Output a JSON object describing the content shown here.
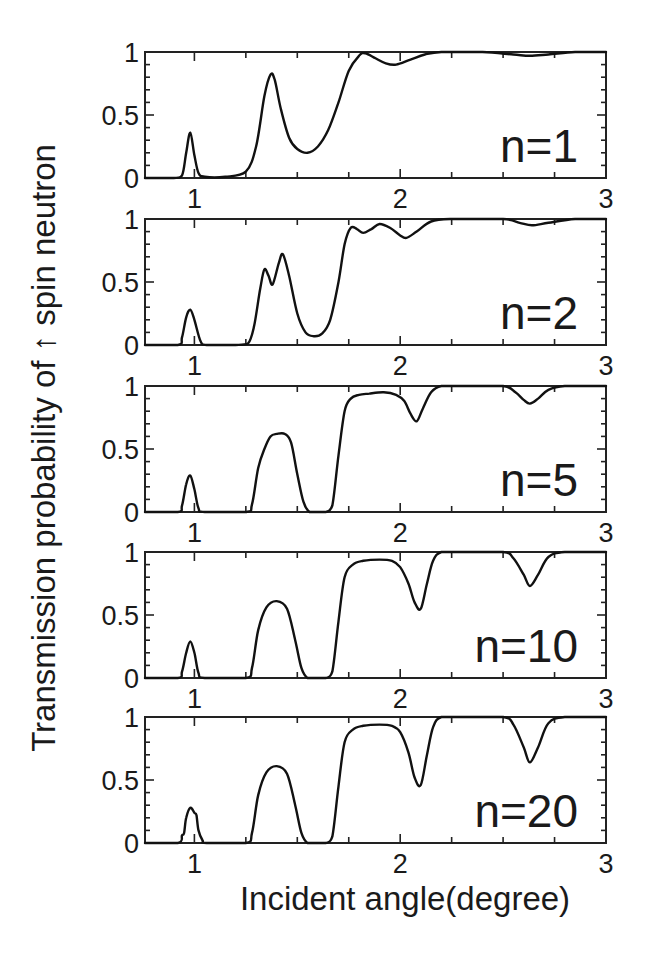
{
  "chart_data": {
    "type": "line",
    "title": "",
    "xlabel": "Incident angle(degree)",
    "ylabel": "Transmission probability of ↑ spin neutron",
    "xlim": [
      0.76,
      3.0
    ],
    "ylim": [
      0,
      1
    ],
    "xticks": [
      1,
      2,
      3
    ],
    "xtick_labels": [
      "1",
      "2",
      "3"
    ],
    "x_minor_step": 0.25,
    "yticks": [
      0,
      0.5,
      1
    ],
    "ytick_labels": [
      "0",
      "0.5",
      "1"
    ],
    "y_minor_step": 0.1,
    "grid": false,
    "layout": "5 vertically stacked panels sharing x axis",
    "panels": [
      {
        "label": "n=1",
        "x": [
          0.76,
          0.9,
          0.94,
          0.96,
          0.98,
          1.0,
          1.02,
          1.05,
          1.15,
          1.25,
          1.3,
          1.34,
          1.37,
          1.39,
          1.42,
          1.46,
          1.5,
          1.55,
          1.6,
          1.65,
          1.7,
          1.75,
          1.8,
          1.83,
          1.88,
          1.93,
          1.98,
          2.05,
          2.12,
          2.2,
          2.4,
          2.55,
          2.63,
          2.72,
          2.85,
          3.0
        ],
        "y": [
          0.0,
          0.0,
          0.02,
          0.2,
          0.36,
          0.18,
          0.04,
          0.01,
          0.01,
          0.05,
          0.25,
          0.65,
          0.82,
          0.78,
          0.55,
          0.32,
          0.23,
          0.2,
          0.25,
          0.38,
          0.6,
          0.85,
          0.97,
          0.99,
          0.95,
          0.91,
          0.9,
          0.94,
          0.98,
          1.0,
          1.0,
          0.98,
          0.97,
          0.98,
          1.0,
          1.0
        ]
      },
      {
        "label": "n=2",
        "x": [
          0.76,
          0.92,
          0.94,
          0.96,
          0.98,
          1.0,
          1.03,
          1.06,
          1.2,
          1.26,
          1.29,
          1.32,
          1.34,
          1.36,
          1.38,
          1.41,
          1.43,
          1.46,
          1.5,
          1.54,
          1.58,
          1.62,
          1.66,
          1.7,
          1.73,
          1.76,
          1.79,
          1.82,
          1.86,
          1.9,
          1.95,
          2.0,
          2.03,
          2.08,
          2.15,
          2.25,
          2.5,
          2.58,
          2.64,
          2.72,
          2.85,
          3.0
        ],
        "y": [
          0.0,
          0.0,
          0.06,
          0.22,
          0.28,
          0.2,
          0.03,
          0.0,
          0.0,
          0.01,
          0.15,
          0.45,
          0.6,
          0.55,
          0.48,
          0.65,
          0.72,
          0.55,
          0.25,
          0.1,
          0.07,
          0.09,
          0.2,
          0.5,
          0.8,
          0.93,
          0.92,
          0.89,
          0.92,
          0.96,
          0.93,
          0.87,
          0.85,
          0.9,
          0.98,
          1.0,
          1.0,
          0.97,
          0.95,
          0.97,
          1.0,
          1.0
        ]
      },
      {
        "label": "n=5",
        "x": [
          0.76,
          0.92,
          0.94,
          0.96,
          0.98,
          1.0,
          1.02,
          1.05,
          1.25,
          1.28,
          1.31,
          1.34,
          1.37,
          1.4,
          1.44,
          1.47,
          1.5,
          1.53,
          1.56,
          1.6,
          1.64,
          1.67,
          1.7,
          1.73,
          1.76,
          1.8,
          1.85,
          1.92,
          1.98,
          2.02,
          2.05,
          2.08,
          2.11,
          2.15,
          2.2,
          2.3,
          2.5,
          2.56,
          2.6,
          2.63,
          2.67,
          2.72,
          2.8,
          3.0
        ],
        "y": [
          0.0,
          0.0,
          0.05,
          0.22,
          0.29,
          0.18,
          0.03,
          0.0,
          0.0,
          0.06,
          0.35,
          0.5,
          0.6,
          0.62,
          0.62,
          0.55,
          0.3,
          0.08,
          0.0,
          0.0,
          0.0,
          0.05,
          0.45,
          0.8,
          0.9,
          0.93,
          0.94,
          0.95,
          0.93,
          0.88,
          0.78,
          0.72,
          0.82,
          0.95,
          1.0,
          1.0,
          1.0,
          0.95,
          0.89,
          0.86,
          0.9,
          0.97,
          1.0,
          1.0
        ]
      },
      {
        "label": "n=10",
        "x": [
          0.76,
          0.92,
          0.94,
          0.96,
          0.98,
          1.0,
          1.02,
          1.05,
          1.25,
          1.28,
          1.31,
          1.35,
          1.4,
          1.45,
          1.49,
          1.52,
          1.55,
          1.6,
          1.64,
          1.67,
          1.7,
          1.73,
          1.77,
          1.82,
          1.9,
          1.96,
          2.0,
          2.04,
          2.07,
          2.1,
          2.13,
          2.16,
          2.2,
          2.3,
          2.5,
          2.55,
          2.6,
          2.63,
          2.67,
          2.72,
          2.8,
          3.0
        ],
        "y": [
          0.0,
          0.0,
          0.05,
          0.2,
          0.29,
          0.2,
          0.04,
          0.0,
          0.0,
          0.08,
          0.38,
          0.56,
          0.61,
          0.55,
          0.3,
          0.08,
          0.0,
          0.0,
          0.0,
          0.05,
          0.45,
          0.8,
          0.9,
          0.93,
          0.94,
          0.93,
          0.88,
          0.75,
          0.6,
          0.55,
          0.75,
          0.93,
          1.0,
          1.0,
          1.0,
          0.95,
          0.82,
          0.73,
          0.82,
          0.96,
          1.0,
          1.0
        ]
      },
      {
        "label": "n=20",
        "x": [
          0.76,
          0.92,
          0.94,
          0.95,
          0.96,
          0.98,
          1.0,
          1.01,
          1.02,
          1.04,
          1.06,
          1.25,
          1.28,
          1.31,
          1.35,
          1.4,
          1.45,
          1.49,
          1.52,
          1.55,
          1.6,
          1.64,
          1.67,
          1.7,
          1.73,
          1.77,
          1.82,
          1.9,
          1.96,
          2.0,
          2.04,
          2.07,
          2.1,
          2.13,
          2.16,
          2.2,
          2.3,
          2.5,
          2.55,
          2.6,
          2.63,
          2.67,
          2.72,
          2.8,
          3.0
        ],
        "y": [
          0.0,
          0.0,
          0.06,
          0.08,
          0.2,
          0.28,
          0.24,
          0.22,
          0.1,
          0.02,
          0.0,
          0.0,
          0.08,
          0.38,
          0.56,
          0.61,
          0.55,
          0.3,
          0.08,
          0.0,
          0.0,
          0.0,
          0.05,
          0.45,
          0.8,
          0.9,
          0.93,
          0.94,
          0.93,
          0.88,
          0.72,
          0.52,
          0.46,
          0.7,
          0.92,
          1.0,
          1.0,
          1.0,
          0.94,
          0.76,
          0.64,
          0.76,
          0.95,
          1.0,
          1.0
        ]
      }
    ]
  },
  "geometry": {
    "plot_left": 145,
    "plot_right": 606,
    "panels_top": [
      52,
      219,
      386,
      552,
      717
    ],
    "panel_height": 126
  }
}
